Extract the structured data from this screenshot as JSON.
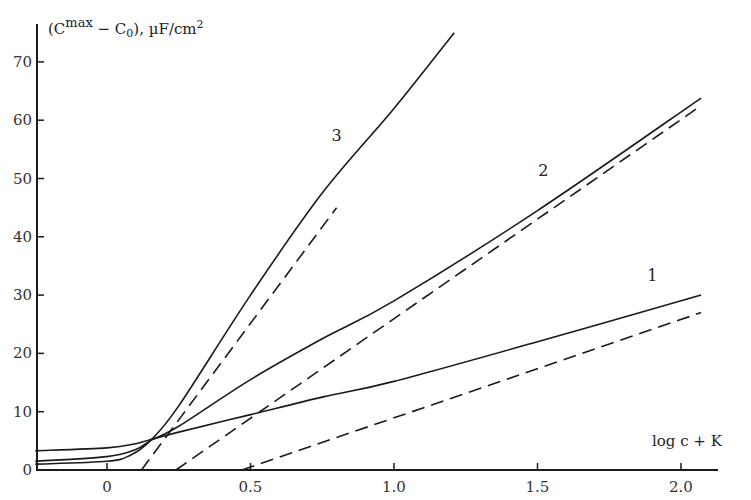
{
  "chart_data": {
    "type": "line",
    "title": "",
    "xlabel": "log c + K",
    "ylabel": "(C^max - C0), µF/cm²",
    "ylabel_parts": {
      "open": "(C",
      "sup": "max",
      "mid": " − C",
      "sub": "0",
      "close": "), µF/cm",
      "sup2": "2"
    },
    "xlim": [
      -0.25,
      2.12
    ],
    "ylim": [
      0,
      76
    ],
    "grid": false,
    "legend": "none (curves labeled inline 1, 2, 3)",
    "x_ticks": [
      0,
      0.5,
      1.0,
      1.5,
      2.0
    ],
    "x_tick_labels": [
      "0",
      "0.5",
      "1.0",
      "1.5",
      "2.0"
    ],
    "y_ticks": [
      0,
      10,
      20,
      30,
      40,
      50,
      60,
      70
    ],
    "y_tick_labels": [
      "0",
      "10",
      "20",
      "30",
      "40",
      "50",
      "60",
      "70"
    ],
    "series": [
      {
        "name": "1",
        "style": "solid",
        "x": [
          -0.25,
          0,
          0.1,
          0.15,
          0.25,
          0.5,
          0.75,
          1.0,
          1.5,
          2.07
        ],
        "y": [
          3.3,
          3.8,
          4.5,
          5.2,
          6.5,
          9.5,
          12.5,
          15.2,
          22,
          30
        ]
      },
      {
        "name": "1 (asymptote)",
        "style": "dashed",
        "x": [
          0.47,
          2.07
        ],
        "y": [
          0,
          27
        ]
      },
      {
        "name": "2",
        "style": "solid",
        "x": [
          -0.25,
          0,
          0.1,
          0.15,
          0.25,
          0.5,
          0.75,
          1.0,
          1.5,
          2.07
        ],
        "y": [
          1.5,
          2.3,
          3.5,
          5.0,
          7.5,
          15.5,
          22.5,
          29,
          44.5,
          63.8
        ]
      },
      {
        "name": "2 (asymptote)",
        "style": "dashed",
        "x": [
          0.24,
          2.07
        ],
        "y": [
          0,
          62.5
        ]
      },
      {
        "name": "3",
        "style": "solid",
        "x": [
          -0.25,
          0,
          0.08,
          0.15,
          0.25,
          0.5,
          0.75,
          1.0,
          1.21
        ],
        "y": [
          1.0,
          1.5,
          2.5,
          5.0,
          11,
          30,
          47.5,
          62,
          75
        ]
      },
      {
        "name": "3 (asymptote)",
        "style": "dashed",
        "x": [
          0.12,
          0.8
        ],
        "y": [
          0,
          45
        ]
      }
    ],
    "annotations": [
      {
        "text": "1",
        "x": 1.9,
        "y": 32.5
      },
      {
        "text": "2",
        "x": 1.52,
        "y": 50.5
      },
      {
        "text": "3",
        "x": 0.8,
        "y": 56.5
      }
    ]
  },
  "style": {
    "line_color": "#1a1a1a",
    "axis_color": "#1a1a1a",
    "background": "#ffffff"
  }
}
